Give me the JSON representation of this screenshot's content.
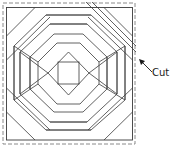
{
  "diagram": {
    "title": "",
    "annotation": {
      "label": "Cut"
    },
    "colors": {
      "line": "#3a3a3a",
      "dashed": "#8a8a8a",
      "background": "#ffffff"
    }
  }
}
